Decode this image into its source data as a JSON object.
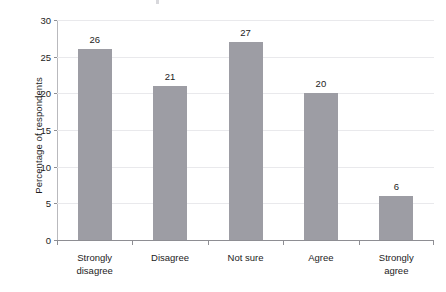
{
  "chart_data": {
    "type": "bar",
    "title": "",
    "xlabel": "",
    "ylabel": "Percentage of respondents",
    "categories": [
      "Strongly disagree",
      "Disagree",
      "Not sure",
      "Agree",
      "Strongly agree"
    ],
    "category_lines": [
      [
        "Strongly",
        "disagree"
      ],
      [
        "Disagree"
      ],
      [
        "Not sure"
      ],
      [
        "Agree"
      ],
      [
        "Strongly agree"
      ]
    ],
    "values": [
      26,
      21,
      27,
      20,
      6
    ],
    "value_labels": [
      "26",
      "21",
      "27",
      "20",
      "6"
    ],
    "ylim": [
      0,
      30
    ],
    "ytick_values": [
      0,
      5,
      10,
      15,
      20,
      25,
      30
    ],
    "ytick_labels": [
      "0",
      "5",
      "10",
      "15",
      "20",
      "25",
      "30"
    ],
    "grid": true,
    "legend": "none",
    "bar_color": "#9d9da4",
    "gridline_color": "#e9e9ec",
    "axis_color": "#8e8e93",
    "text_color": "#1c1c1c"
  }
}
